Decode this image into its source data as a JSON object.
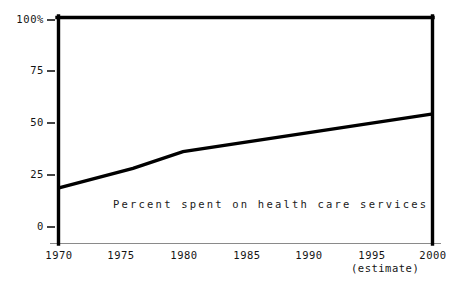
{
  "chart_data": {
    "type": "line",
    "title": "",
    "subtitle": "",
    "xlabel": "",
    "ylabel": "",
    "annotations": [
      {
        "name": "series-caption",
        "text": "Percent spent on health care services"
      },
      {
        "name": "estimate-note",
        "text": "(estimate)"
      }
    ],
    "grid": false,
    "legend": "none",
    "xlim": [
      1970,
      2000
    ],
    "ylim": [
      0,
      100
    ],
    "x_ticks": [
      1970,
      1975,
      1980,
      1985,
      1990,
      1995,
      2000
    ],
    "x_tick_labels": [
      "1970",
      "1975",
      "1980",
      "1985",
      "1990",
      "1995",
      "2000"
    ],
    "y_ticks": [
      0,
      25,
      50,
      75,
      100
    ],
    "y_tick_labels": [
      "0",
      "25",
      "50",
      "75",
      "100%"
    ],
    "series": [
      {
        "name": "Percent spent on health care services",
        "x": [
          1970,
          1976,
          1980,
          2000
        ],
        "values": [
          18.5,
          28,
          36,
          54
        ],
        "color": "#000000"
      }
    ],
    "reference_lines": [
      {
        "name": "hundred-percent-top-rule",
        "orientation": "horizontal",
        "value": 100,
        "color": "#000000"
      },
      {
        "name": "left-axis-rule",
        "orientation": "vertical",
        "value": 1970,
        "color": "#000000"
      },
      {
        "name": "right-axis-rule",
        "orientation": "vertical",
        "value": 2000,
        "color": "#000000"
      },
      {
        "name": "baseline-rule",
        "orientation": "horizontal",
        "value": 0,
        "color": "#8a8a8a"
      }
    ],
    "colors": {
      "background": "#ffffff",
      "line": "#000000",
      "axis": "#000000",
      "baseline": "#8a8a8a",
      "text": "#141414"
    }
  }
}
